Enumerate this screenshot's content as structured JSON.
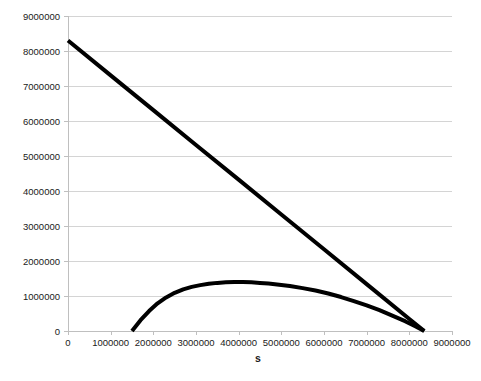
{
  "chart_data": {
    "type": "line",
    "title": "",
    "xlabel": "s",
    "ylabel": "",
    "xlim": [
      0,
      9000000
    ],
    "ylim": [
      0,
      9000000
    ],
    "grid": true,
    "legend": false,
    "legend_position": "none",
    "x_ticks": [
      0,
      1000000,
      2000000,
      3000000,
      4000000,
      5000000,
      6000000,
      7000000,
      8000000,
      9000000
    ],
    "x_tick_labels": [
      "0",
      "1000000",
      "2000000",
      "3000000",
      "4000000",
      "5000000",
      "6000000",
      "7000000",
      "8000000",
      "9000000"
    ],
    "y_ticks": [
      0,
      1000000,
      2000000,
      3000000,
      4000000,
      5000000,
      6000000,
      7000000,
      8000000,
      9000000
    ],
    "y_tick_labels": [
      "0",
      "1000000",
      "2000000",
      "3000000",
      "4000000",
      "5000000",
      "6000000",
      "7000000",
      "8000000",
      "9000000"
    ],
    "series": [
      {
        "name": "descending-line",
        "color": "#000000",
        "line_width": 4,
        "points": [
          [
            0,
            8300000
          ],
          [
            1000000,
            7305000
          ],
          [
            2000000,
            6310000
          ],
          [
            3000000,
            5315000
          ],
          [
            4000000,
            4325000
          ],
          [
            5000000,
            3330000
          ],
          [
            6000000,
            2335000
          ],
          [
            7000000,
            1340000
          ],
          [
            8000000,
            345000
          ],
          [
            8350000,
            0
          ]
        ]
      },
      {
        "name": "concave-curve",
        "color": "#000000",
        "line_width": 4,
        "points": [
          [
            1500000,
            0
          ],
          [
            1700000,
            310000
          ],
          [
            1900000,
            570000
          ],
          [
            2100000,
            790000
          ],
          [
            2300000,
            960000
          ],
          [
            2500000,
            1090000
          ],
          [
            2700000,
            1190000
          ],
          [
            2900000,
            1260000
          ],
          [
            3100000,
            1310000
          ],
          [
            3300000,
            1350000
          ],
          [
            3500000,
            1375000
          ],
          [
            3700000,
            1390000
          ],
          [
            3900000,
            1400000
          ],
          [
            4100000,
            1400000
          ],
          [
            4300000,
            1390000
          ],
          [
            4500000,
            1375000
          ],
          [
            4700000,
            1355000
          ],
          [
            4900000,
            1330000
          ],
          [
            5200000,
            1285000
          ],
          [
            5500000,
            1225000
          ],
          [
            5800000,
            1155000
          ],
          [
            6100000,
            1070000
          ],
          [
            6400000,
            970000
          ],
          [
            6700000,
            855000
          ],
          [
            7000000,
            730000
          ],
          [
            7300000,
            595000
          ],
          [
            7600000,
            440000
          ],
          [
            7900000,
            280000
          ],
          [
            8150000,
            130000
          ],
          [
            8350000,
            0
          ]
        ]
      }
    ]
  },
  "plot_geometry": {
    "left": 68,
    "top": 16,
    "right": 452,
    "bottom": 331
  }
}
